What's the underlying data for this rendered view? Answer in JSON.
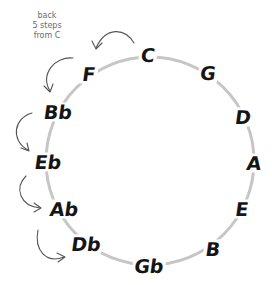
{
  "diagram": {
    "note_lines": [
      "back",
      "5 steps",
      "from C"
    ],
    "circle": {
      "center_x": 150,
      "center_y": 161,
      "radius": 104,
      "stroke_color": "#c6c6c6",
      "stroke_width": 3
    },
    "keys": [
      {
        "label": "C",
        "x": 148,
        "y": 55
      },
      {
        "label": "G",
        "x": 208,
        "y": 73
      },
      {
        "label": "D",
        "x": 243,
        "y": 117
      },
      {
        "label": "A",
        "x": 254,
        "y": 163
      },
      {
        "label": "E",
        "x": 242,
        "y": 209
      },
      {
        "label": "B",
        "x": 213,
        "y": 249
      },
      {
        "label": "Gb",
        "x": 149,
        "y": 266
      },
      {
        "label": "Db",
        "x": 86,
        "y": 244
      },
      {
        "label": "Ab",
        "x": 64,
        "y": 209
      },
      {
        "label": "Eb",
        "x": 48,
        "y": 162
      },
      {
        "label": "Bb",
        "x": 58,
        "y": 112
      },
      {
        "label": "F",
        "x": 89,
        "y": 74
      }
    ],
    "arrows": [
      {
        "from": "C",
        "to": "F"
      },
      {
        "from": "F",
        "to": "Bb"
      },
      {
        "from": "Bb",
        "to": "Eb"
      },
      {
        "from": "Eb",
        "to": "Ab"
      },
      {
        "from": "Ab",
        "to": "Db"
      }
    ],
    "arrow_color": "#555555",
    "text_color": "#151515"
  }
}
